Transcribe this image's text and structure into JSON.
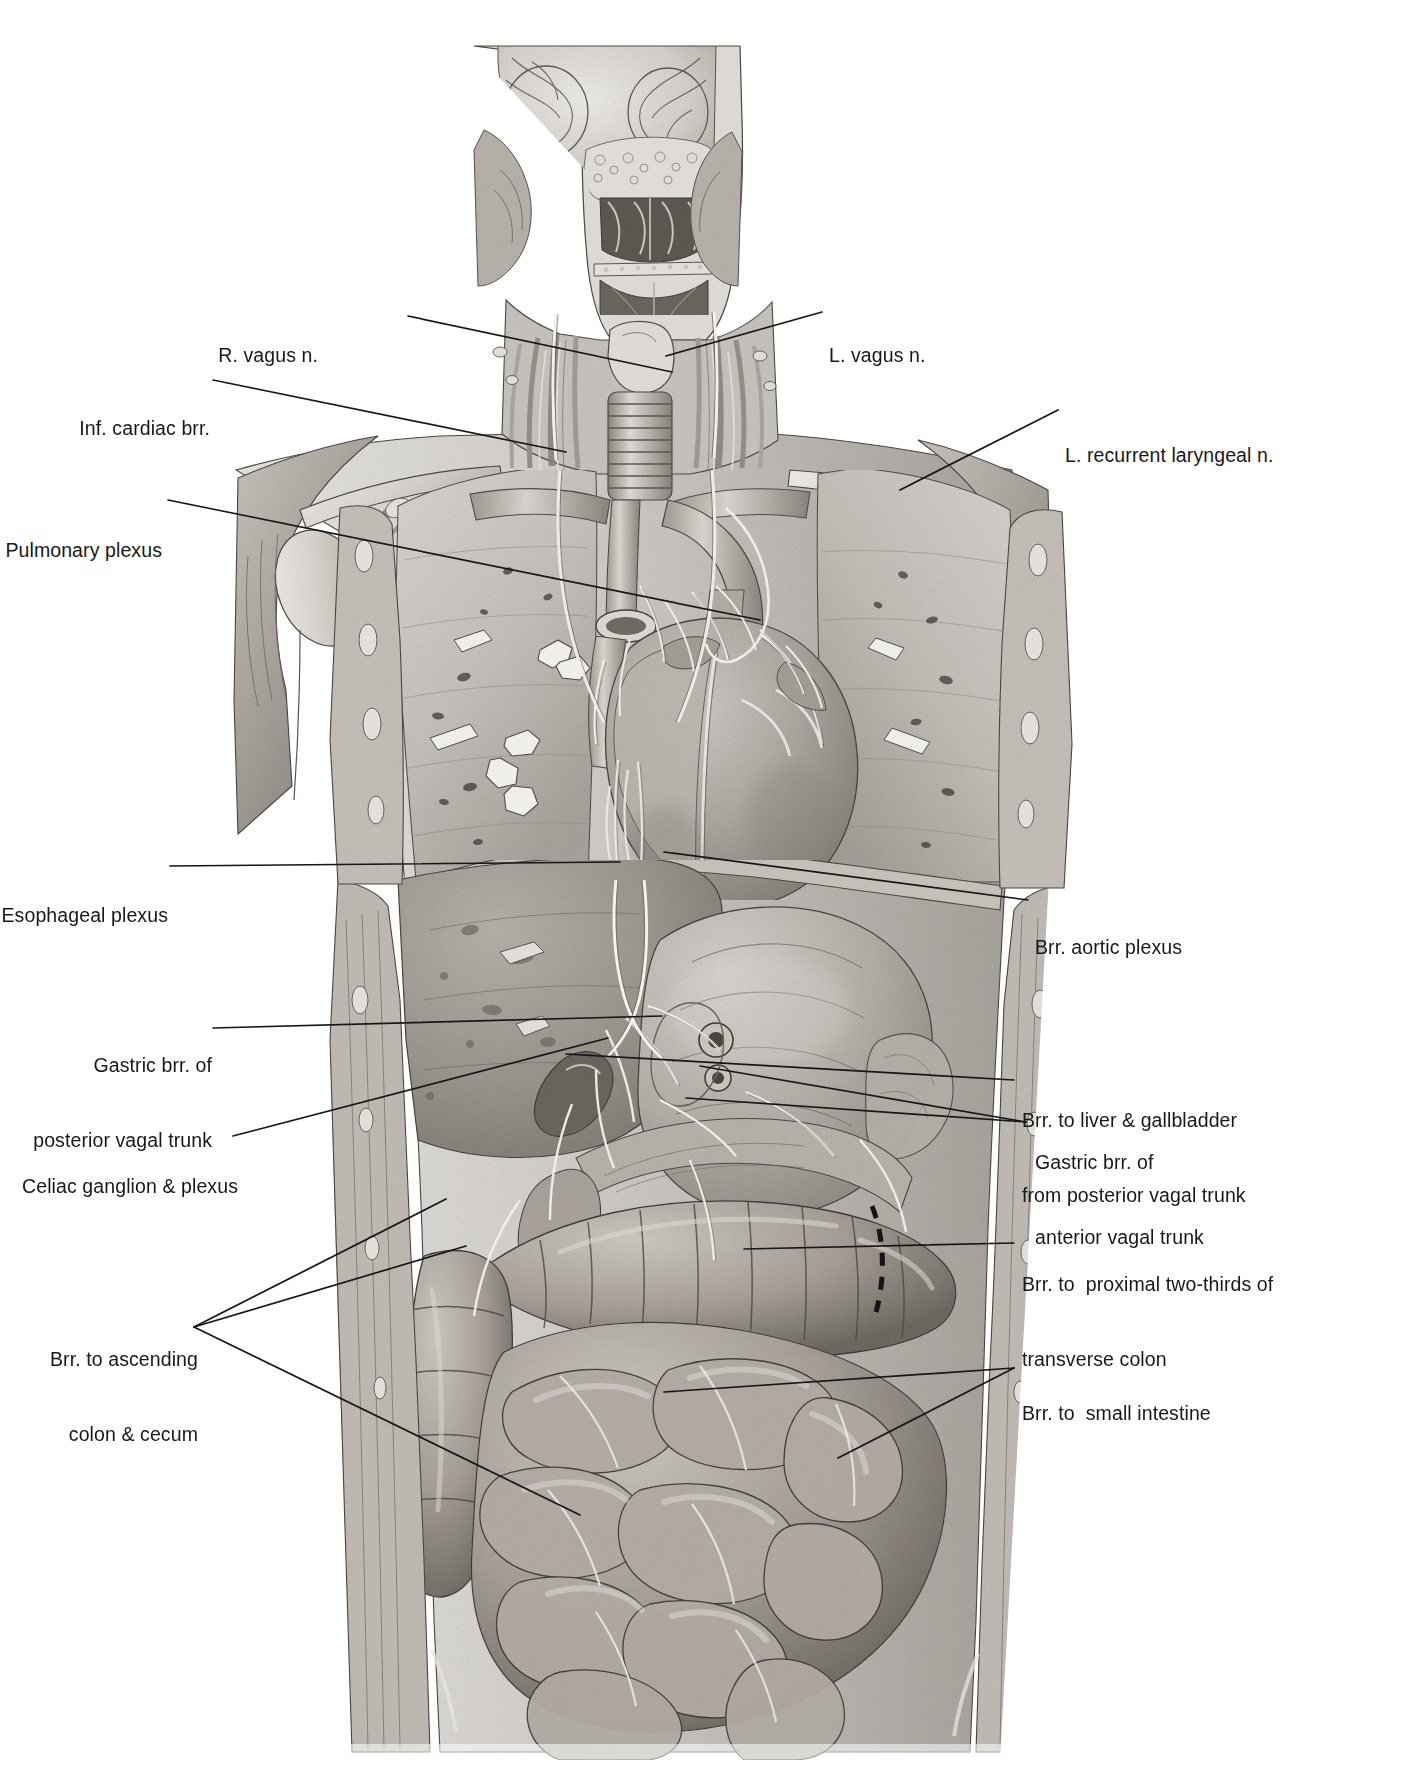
{
  "figure": {
    "kind": "anatomical-illustration",
    "view": "anterior coronal section of head, neck, thorax and abdomen",
    "style": "grayscale medical plate, pencil / airbrush rendering on white",
    "background_color": "#ffffff",
    "ink_color": "#1b1b1b"
  },
  "labels": {
    "r_vagus": {
      "lines": [
        "R. vagus n."
      ],
      "side": "left",
      "x": 318,
      "y": 303
    },
    "inf_cardiac": {
      "lines": [
        "Inf. cardiac brr."
      ],
      "side": "left",
      "x": 100,
      "y": 365
    },
    "pulmonary_plexus": {
      "lines": [
        "Pulmonary plexus"
      ],
      "side": "left",
      "x": 38,
      "y": 492
    },
    "esophageal_plexus": {
      "lines": [
        "Esophageal plexus"
      ],
      "side": "left",
      "x": 38,
      "y": 855
    },
    "gastric_posterior": {
      "lines": [
        "Gastric brr. of",
        "posterior vagal trunk"
      ],
      "side": "left",
      "x": 57,
      "y": 1013
    },
    "celiac": {
      "lines": [
        "Celiac ganglion & plexus"
      ],
      "side": "left",
      "x": 46,
      "y": 1125
    },
    "ascending_colon": {
      "lines": [
        "Brr. to ascending",
        "colon & cecum"
      ],
      "side": "left",
      "x": 83,
      "y": 1307
    },
    "l_vagus": {
      "lines": [
        "L. vagus n."
      ],
      "side": "right",
      "x": 829,
      "y": 299
    },
    "l_recurrent": {
      "lines": [
        "L. recurrent laryngeal n."
      ],
      "side": "right",
      "x": 1063,
      "y": 398
    },
    "brr_aortic": {
      "lines": [
        "Brr. aortic plexus"
      ],
      "side": "right",
      "x": 1034,
      "y": 890
    },
    "gastric_anterior": {
      "lines": [
        "Gastric brr. of",
        "anterior vagal trunk"
      ],
      "side": "right",
      "x": 1034,
      "y": 1108
    },
    "liver_gallbladder": {
      "lines": [
        "Brr. to liver & gallbladder",
        "from posterior vagal trunk"
      ],
      "side": "right",
      "x": 1021,
      "y": 1063
    },
    "transverse_colon": {
      "lines": [
        "Brr. to  proximal two-thirds of",
        "transverse colon"
      ],
      "side": "right",
      "x": 1021,
      "y": 1229
    },
    "small_intestine": {
      "lines": [
        "Brr. to  small intestine"
      ],
      "side": "right",
      "x": 1021,
      "y": 1357
    }
  },
  "label_list": [
    "R. vagus n.",
    "L. vagus n.",
    "Inf. cardiac brr.",
    "L. recurrent laryngeal n.",
    "Pulmonary plexus",
    "Esophageal plexus",
    "Brr. aortic plexus",
    "Gastric brr. of anterior vagal trunk",
    "Gastric brr. of posterior vagal trunk",
    "Brr. to liver & gallbladder from posterior vagal trunk",
    "Celiac ganglion & plexus",
    "Brr. to proximal two-thirds of transverse colon",
    "Brr. to ascending colon & cecum",
    "Brr. to small intestine"
  ],
  "regions": [
    {
      "name": "head-coronal-section",
      "note": "brain hemispheres, nasal cavity, paranasal sinuses, tongue, pharynx"
    },
    {
      "name": "neck",
      "note": "trachea, larynx, carotid sheath vessels, cervical nerves"
    },
    {
      "name": "shoulder-left",
      "note": "clavicle, scapula, humeral head, deltoid, axillary vessels"
    },
    {
      "name": "shoulder-right",
      "note": "clavicle, scapula, humeral head, deltoid, axillary vessels"
    },
    {
      "name": "lungs",
      "note": "right and left lung fields with bronchi and vessels"
    },
    {
      "name": "heart",
      "note": "heart with aortic arch, pulmonary trunk, coronary vessels"
    },
    {
      "name": "diaphragm",
      "note": "dome of diaphragm"
    },
    {
      "name": "liver",
      "note": "right upper quadrant liver mass"
    },
    {
      "name": "stomach",
      "note": "stomach with greater and lesser curvature"
    },
    {
      "name": "gallbladder",
      "note": "gallbladder below liver edge"
    },
    {
      "name": "pancreas-duodenum",
      "note": "pancreas, duodenal C-loop"
    },
    {
      "name": "transverse-colon",
      "note": "haustrated transverse colon with dashed transition mark"
    },
    {
      "name": "ascending-colon",
      "note": "ascending colon and cecum, right side"
    },
    {
      "name": "small-intestine",
      "note": "coils of jejunum and ileum filling lower abdomen"
    },
    {
      "name": "abdominal-wall",
      "note": "rectus abdominis and lateral muscle layers"
    }
  ]
}
